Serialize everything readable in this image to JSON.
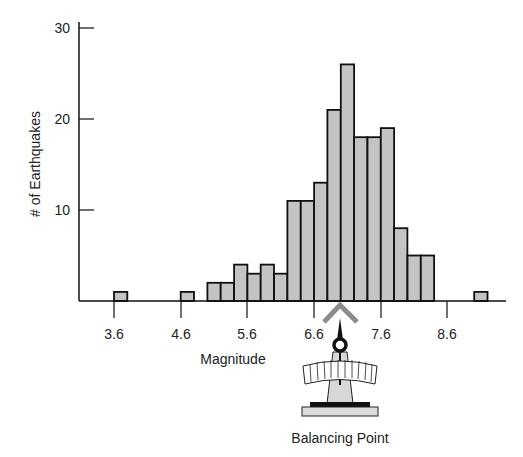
{
  "chart_data": {
    "type": "bar",
    "title": "",
    "xlabel": "Magnitude",
    "ylabel": "# of Earthquakes",
    "bin_width": 0.2,
    "bin_starts": [
      3.6,
      4.6,
      5.0,
      5.2,
      5.4,
      5.6,
      5.8,
      6.0,
      6.2,
      6.4,
      6.6,
      6.8,
      7.0,
      7.2,
      7.4,
      7.6,
      7.8,
      8.0,
      8.2,
      9.0
    ],
    "values": [
      1,
      1,
      2,
      2,
      4,
      3,
      4,
      3,
      11,
      11,
      13,
      21,
      26,
      18,
      18,
      19,
      8,
      5,
      5,
      1
    ],
    "x_ticks": [
      "3.6",
      "4.6",
      "5.6",
      "6.6",
      "7.6",
      "8.6"
    ],
    "y_ticks": [
      "10",
      "20",
      "30"
    ],
    "ylim": [
      0,
      30
    ],
    "xlim": [
      3.1,
      9.4
    ],
    "grid": false,
    "annotation": "Balancing Point",
    "colors": {
      "bar_fill": "#c4c4c4",
      "bar_edge": "#111111",
      "fulcrum": "#8c8c8c"
    }
  },
  "labels": {
    "ylabel": "# of Earthquakes",
    "xlabel": "Magnitude",
    "annotation": "Balancing Point",
    "x_ticks": [
      "3.6",
      "4.6",
      "5.6",
      "6.6",
      "7.6",
      "8.6"
    ],
    "y_ticks": [
      "10",
      "20",
      "30"
    ]
  }
}
